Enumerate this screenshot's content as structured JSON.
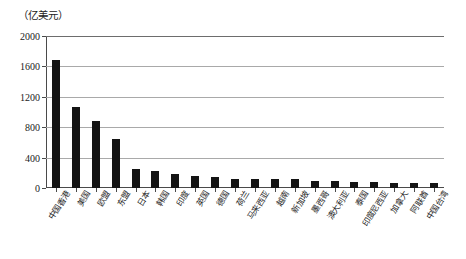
{
  "figure": {
    "unit_label": "（亿美元）",
    "axis_color": "#4a4a4a",
    "grid_color": "#a9a9a9",
    "bar_color": "#141414",
    "background": "#ffffff"
  },
  "chart_data": {
    "type": "bar",
    "title": "",
    "subtitle": "",
    "xlabel": "",
    "ylabel": "（亿美元）",
    "ylim": [
      0,
      2000
    ],
    "yticks": [
      0,
      400,
      800,
      1200,
      1600,
      2000
    ],
    "ytick_labels": [
      "0",
      "400",
      "800",
      "1200",
      "1600",
      "2000"
    ],
    "grid": true,
    "grid_axis": "y",
    "legend": false,
    "legend_position": "none",
    "categories": [
      "中国香港",
      "美国",
      "欧盟",
      "东盟",
      "日本",
      "韩国",
      "印度",
      "英国",
      "德国",
      "荷兰",
      "马来西亚",
      "越南",
      "新加坡",
      "墨西哥",
      "澳大利亚",
      "泰国",
      "印度尼西亚",
      "加拿大",
      "阿联酋",
      "中国台湾"
    ],
    "values": [
      1680,
      1070,
      880,
      640,
      250,
      225,
      180,
      155,
      150,
      125,
      120,
      118,
      115,
      90,
      88,
      82,
      76,
      72,
      70,
      68
    ]
  }
}
